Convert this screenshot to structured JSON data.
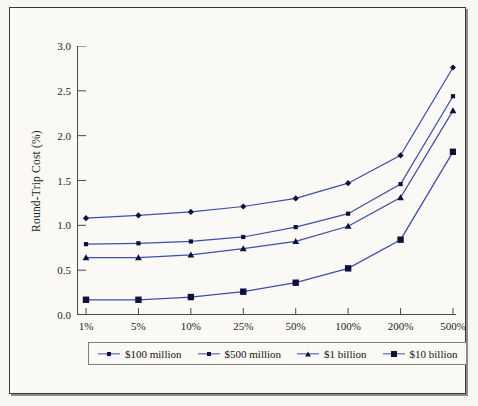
{
  "figure": {
    "background_color": "#faf9f5",
    "frame_color": "#3a3a3a",
    "line_color": "#3f4fa8",
    "marker_color": "#10103a"
  },
  "chart_data": {
    "type": "line",
    "title": "",
    "xlabel": "",
    "ylabel": "Round-Trip Cost (%)",
    "categories": [
      "1%",
      "5%",
      "10%",
      "25%",
      "50%",
      "100%",
      "200%",
      "500%"
    ],
    "ylim": [
      0.0,
      3.0
    ],
    "yticks": [
      "3.0",
      "2.5",
      "2.0",
      "1.5",
      "1.0",
      "0.5",
      "0.0"
    ],
    "ytick_values": [
      3.0,
      2.5,
      2.0,
      1.5,
      1.0,
      0.5,
      0.0
    ],
    "grid": false,
    "legend_position": "below-axes",
    "series": [
      {
        "name": "$100 million",
        "marker": "diamond",
        "values": [
          1.08,
          1.11,
          1.15,
          1.21,
          1.3,
          1.47,
          1.78,
          2.76
        ]
      },
      {
        "name": "$500 million",
        "marker": "square-small",
        "values": [
          0.79,
          0.8,
          0.82,
          0.87,
          0.98,
          1.13,
          1.46,
          2.44
        ]
      },
      {
        "name": "$1 billion",
        "marker": "triangle",
        "values": [
          0.64,
          0.64,
          0.67,
          0.74,
          0.82,
          0.99,
          1.31,
          2.28
        ]
      },
      {
        "name": "$10 billion",
        "marker": "square-large",
        "values": [
          0.17,
          0.17,
          0.2,
          0.26,
          0.36,
          0.52,
          0.84,
          1.82
        ]
      }
    ]
  }
}
